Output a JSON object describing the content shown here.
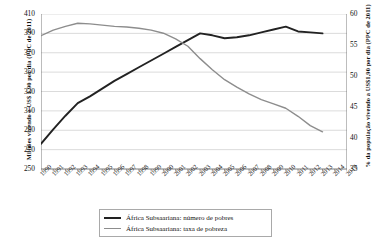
{
  "chart_data": {
    "type": "line",
    "title": "",
    "subtitle": "",
    "xlabel": "",
    "ylabel": "Milhões vivendo a US$ 1,90 por dia (PPC de 2011)",
    "y2label": "% da população vivendo a US$1,90 por dia (PPC de 2011)",
    "grid": true,
    "legend_position": "bottom-center",
    "x": [
      1990,
      1991,
      1992,
      1993,
      1994,
      1995,
      1996,
      1997,
      1998,
      1999,
      2000,
      2001,
      2002,
      2003,
      2004,
      2005,
      2006,
      2007,
      2008,
      2009,
      2010,
      2011,
      2012,
      2013,
      2014,
      2015
    ],
    "xtick_labels": [
      "1990",
      "1991",
      "1992",
      "1993",
      "1994",
      "1995",
      "1996",
      "1997",
      "1998",
      "1999",
      "2000",
      "2001",
      "2002",
      "2003",
      "2004",
      "2005",
      "2006",
      "2007",
      "2008",
      "2009",
      "2010",
      "2011",
      "2012",
      "2013",
      "2014",
      "2015"
    ],
    "ylim": [
      250,
      410
    ],
    "ytick_labels": [
      "250",
      "270",
      "290",
      "310",
      "330",
      "350",
      "370",
      "390",
      "410"
    ],
    "yticks": [
      250,
      270,
      290,
      310,
      330,
      350,
      370,
      390,
      410
    ],
    "y2lim": [
      35,
      60
    ],
    "y2tick_labels": [
      "35",
      "40",
      "45",
      "50",
      "55",
      "60"
    ],
    "y2ticks": [
      35,
      40,
      45,
      50,
      55,
      60
    ],
    "series": [
      {
        "name": "África Subsaariana: número de pobres",
        "axis": "left",
        "color": "#222222",
        "units": "milhões",
        "values": [
          276,
          291,
          305,
          318,
          325,
          333,
          341,
          348,
          355,
          362,
          369,
          376,
          383,
          390,
          388,
          385,
          386,
          388,
          391,
          394,
          397,
          392,
          391,
          390,
          null,
          null
        ]
      },
      {
        "name": "África Subsaariana: taxa de pobreza",
        "axis": "right",
        "color": "#8d8d8d",
        "units": "%",
        "values": [
          56.5,
          57.4,
          58.0,
          58.5,
          58.4,
          58.2,
          58.0,
          57.9,
          57.7,
          57.4,
          56.9,
          56.0,
          54.8,
          52.8,
          51.0,
          49.4,
          48.2,
          47.1,
          46.2,
          45.5,
          44.8,
          43.5,
          42.0,
          41.0,
          null,
          null
        ]
      }
    ]
  }
}
